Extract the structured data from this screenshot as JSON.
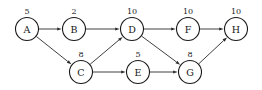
{
  "graph": {
    "type": "directed-acyclic-graph",
    "background_color": "#ffffff",
    "node_fill_color": "#ffffff",
    "node_stroke_color": "#1a1a1a",
    "edge_color": "#2a2a2a",
    "text_color": "#151515",
    "node_radius": 11.5,
    "nodes": [
      {
        "id": "A",
        "label": "A",
        "weight": "5",
        "cx": 27,
        "cy": 29
      },
      {
        "id": "B",
        "label": "B",
        "weight": "2",
        "cx": 74,
        "cy": 29
      },
      {
        "id": "D",
        "label": "D",
        "weight": "10",
        "cx": 132,
        "cy": 29
      },
      {
        "id": "F",
        "label": "F",
        "weight": "10",
        "cx": 188,
        "cy": 29
      },
      {
        "id": "H",
        "label": "H",
        "weight": "10",
        "cx": 236,
        "cy": 29
      },
      {
        "id": "C",
        "label": "C",
        "weight": "8",
        "cx": 81,
        "cy": 72
      },
      {
        "id": "E",
        "label": "E",
        "weight": "5",
        "cx": 138,
        "cy": 72
      },
      {
        "id": "G",
        "label": "G",
        "weight": "8",
        "cx": 190,
        "cy": 72
      }
    ],
    "edges": [
      {
        "from": "A",
        "to": "B"
      },
      {
        "from": "A",
        "to": "C"
      },
      {
        "from": "B",
        "to": "D"
      },
      {
        "from": "C",
        "to": "D"
      },
      {
        "from": "C",
        "to": "E"
      },
      {
        "from": "D",
        "to": "F"
      },
      {
        "from": "D",
        "to": "G"
      },
      {
        "from": "E",
        "to": "G"
      },
      {
        "from": "F",
        "to": "H"
      },
      {
        "from": "G",
        "to": "H"
      }
    ]
  }
}
